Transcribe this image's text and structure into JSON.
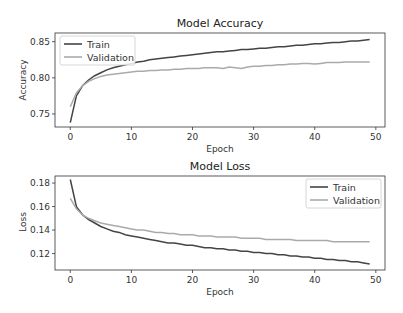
{
  "chart_data": [
    {
      "type": "line",
      "title": "Model Accuracy",
      "xlabel": "Epoch",
      "ylabel": "Accuracy",
      "xlim": [
        -2.5,
        51.5
      ],
      "ylim": [
        0.732,
        0.862
      ],
      "xticks": [
        0,
        10,
        20,
        30,
        40,
        50
      ],
      "yticks": [
        0.75,
        0.8,
        0.85
      ],
      "ytick_labels": [
        "0.75",
        "0.80",
        "0.85"
      ],
      "legend_position": "upper left",
      "grid": false,
      "series": [
        {
          "name": "Train",
          "color": "#444444",
          "x": [
            0,
            1,
            2,
            3,
            4,
            5,
            6,
            7,
            8,
            9,
            10,
            11,
            12,
            13,
            14,
            15,
            16,
            17,
            18,
            19,
            20,
            21,
            22,
            23,
            24,
            25,
            26,
            27,
            28,
            29,
            30,
            31,
            32,
            33,
            34,
            35,
            36,
            37,
            38,
            39,
            40,
            41,
            42,
            43,
            44,
            45,
            46,
            47,
            48,
            49
          ],
          "values": [
            0.738,
            0.775,
            0.789,
            0.797,
            0.803,
            0.807,
            0.811,
            0.814,
            0.816,
            0.818,
            0.82,
            0.822,
            0.823,
            0.825,
            0.826,
            0.827,
            0.828,
            0.829,
            0.83,
            0.831,
            0.832,
            0.833,
            0.834,
            0.835,
            0.836,
            0.836,
            0.837,
            0.838,
            0.839,
            0.839,
            0.84,
            0.841,
            0.841,
            0.842,
            0.843,
            0.843,
            0.844,
            0.845,
            0.845,
            0.846,
            0.847,
            0.847,
            0.848,
            0.849,
            0.849,
            0.85,
            0.851,
            0.851,
            0.852,
            0.853
          ]
        },
        {
          "name": "Validation",
          "color": "#aaaaaa",
          "x": [
            0,
            1,
            2,
            3,
            4,
            5,
            6,
            7,
            8,
            9,
            10,
            11,
            12,
            13,
            14,
            15,
            16,
            17,
            18,
            19,
            20,
            21,
            22,
            23,
            24,
            25,
            26,
            27,
            28,
            29,
            30,
            31,
            32,
            33,
            34,
            35,
            36,
            37,
            38,
            39,
            40,
            41,
            42,
            43,
            44,
            45,
            46,
            47,
            48,
            49
          ],
          "values": [
            0.76,
            0.779,
            0.789,
            0.795,
            0.799,
            0.802,
            0.804,
            0.805,
            0.806,
            0.807,
            0.808,
            0.809,
            0.809,
            0.81,
            0.81,
            0.811,
            0.811,
            0.812,
            0.812,
            0.813,
            0.813,
            0.813,
            0.814,
            0.814,
            0.814,
            0.813,
            0.815,
            0.814,
            0.813,
            0.815,
            0.816,
            0.816,
            0.817,
            0.817,
            0.818,
            0.818,
            0.819,
            0.819,
            0.82,
            0.82,
            0.819,
            0.82,
            0.821,
            0.821,
            0.821,
            0.822,
            0.822,
            0.822,
            0.822,
            0.822
          ]
        }
      ]
    },
    {
      "type": "line",
      "title": "Model Loss",
      "xlabel": "Epoch",
      "ylabel": "Loss",
      "xlim": [
        -2.5,
        51.5
      ],
      "ylim": [
        0.106,
        0.186
      ],
      "xticks": [
        0,
        10,
        20,
        30,
        40,
        50
      ],
      "yticks": [
        0.12,
        0.14,
        0.16,
        0.18
      ],
      "ytick_labels": [
        "0.12",
        "0.14",
        "0.16",
        "0.18"
      ],
      "legend_position": "upper right",
      "grid": false,
      "series": [
        {
          "name": "Train",
          "color": "#444444",
          "x": [
            0,
            1,
            2,
            3,
            4,
            5,
            6,
            7,
            8,
            9,
            10,
            11,
            12,
            13,
            14,
            15,
            16,
            17,
            18,
            19,
            20,
            21,
            22,
            23,
            24,
            25,
            26,
            27,
            28,
            29,
            30,
            31,
            32,
            33,
            34,
            35,
            36,
            37,
            38,
            39,
            40,
            41,
            42,
            43,
            44,
            45,
            46,
            47,
            48,
            49
          ],
          "values": [
            0.183,
            0.16,
            0.153,
            0.149,
            0.146,
            0.143,
            0.141,
            0.139,
            0.138,
            0.136,
            0.135,
            0.134,
            0.133,
            0.132,
            0.131,
            0.13,
            0.129,
            0.129,
            0.128,
            0.127,
            0.127,
            0.126,
            0.125,
            0.125,
            0.124,
            0.124,
            0.123,
            0.123,
            0.122,
            0.122,
            0.121,
            0.121,
            0.12,
            0.12,
            0.119,
            0.119,
            0.118,
            0.118,
            0.117,
            0.117,
            0.116,
            0.116,
            0.115,
            0.115,
            0.114,
            0.114,
            0.113,
            0.113,
            0.112,
            0.111
          ]
        },
        {
          "name": "Validation",
          "color": "#aaaaaa",
          "x": [
            0,
            1,
            2,
            3,
            4,
            5,
            6,
            7,
            8,
            9,
            10,
            11,
            12,
            13,
            14,
            15,
            16,
            17,
            18,
            19,
            20,
            21,
            22,
            23,
            24,
            25,
            26,
            27,
            28,
            29,
            30,
            31,
            32,
            33,
            34,
            35,
            36,
            37,
            38,
            39,
            40,
            41,
            42,
            43,
            44,
            45,
            46,
            47,
            48,
            49
          ],
          "values": [
            0.167,
            0.158,
            0.153,
            0.15,
            0.148,
            0.146,
            0.145,
            0.144,
            0.143,
            0.142,
            0.141,
            0.14,
            0.14,
            0.139,
            0.138,
            0.138,
            0.137,
            0.137,
            0.136,
            0.136,
            0.136,
            0.135,
            0.135,
            0.135,
            0.134,
            0.134,
            0.134,
            0.134,
            0.133,
            0.133,
            0.133,
            0.133,
            0.132,
            0.132,
            0.132,
            0.132,
            0.132,
            0.131,
            0.131,
            0.131,
            0.131,
            0.131,
            0.131,
            0.13,
            0.13,
            0.13,
            0.13,
            0.13,
            0.13,
            0.13
          ]
        }
      ]
    }
  ],
  "panels": [
    {
      "title": "Model Accuracy",
      "xlabel": "Epoch",
      "ylabel": "Accuracy",
      "legend": [
        "Train",
        "Validation"
      ]
    },
    {
      "title": "Model Loss",
      "xlabel": "Epoch",
      "ylabel": "Loss",
      "legend": [
        "Train",
        "Validation"
      ]
    }
  ]
}
